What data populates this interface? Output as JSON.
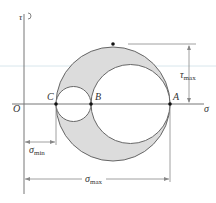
{
  "diagram": {
    "axes": {
      "vertical": "τ",
      "horizontal": "σ",
      "origin": "O"
    },
    "points": {
      "A": "A",
      "B": "B",
      "C": "C"
    },
    "dimensions": {
      "tau_max": "τ",
      "tau_max_sub": "max",
      "sigma_min": "σ",
      "sigma_min_sub": "min",
      "sigma_max": "σ",
      "sigma_max_sub": "max"
    },
    "colors": {
      "fill": "#dcdcdc",
      "stroke": "#555555",
      "axis": "#666666",
      "highlight_line": "#cfe3ea"
    }
  }
}
